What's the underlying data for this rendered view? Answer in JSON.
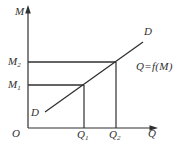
{
  "figure": {
    "background": "#ffffff",
    "ink_color": "#303030",
    "labels": {
      "y_axis": "M",
      "x_axis": "Q",
      "origin": "O",
      "curve_lower": "D",
      "curve_upper": "D",
      "function": "Q=f(M)"
    },
    "ticks": {
      "m2": {
        "base": "M",
        "sub": "2"
      },
      "m1": {
        "base": "M",
        "sub": "1"
      },
      "q1": {
        "base": "Q",
        "sub": "1"
      },
      "q2": {
        "base": "Q",
        "sub": "2"
      }
    },
    "geometry": {
      "width": 182,
      "height": 148,
      "lines": [
        {
          "name": "y-axis-line",
          "x1": 28,
          "y1": 128,
          "x2": 28,
          "y2": 10,
          "w": 1.2
        },
        {
          "name": "x-axis-line",
          "x1": 28,
          "y1": 128,
          "x2": 152,
          "y2": 128,
          "w": 1.2
        },
        {
          "name": "m2-level-line",
          "x1": 28,
          "y1": 62,
          "x2": 116,
          "y2": 62,
          "w": 1.6
        },
        {
          "name": "m1-level-line",
          "x1": 28,
          "y1": 85,
          "x2": 84,
          "y2": 85,
          "w": 1.6
        },
        {
          "name": "q2-projection-line",
          "x1": 116,
          "y1": 62,
          "x2": 116,
          "y2": 128,
          "w": 1.2
        },
        {
          "name": "q1-projection-line",
          "x1": 84,
          "y1": 85,
          "x2": 84,
          "y2": 128,
          "w": 1.2
        },
        {
          "name": "demand-line",
          "x1": 45,
          "y1": 112,
          "x2": 143,
          "y2": 42,
          "w": 1.3
        }
      ],
      "arrows": [
        {
          "name": "y-axis-arrow",
          "points": "28,5 25.2,13.5 30.8,13.5"
        },
        {
          "name": "x-axis-arrow",
          "points": "158,128 149.5,125.2 149.5,130.8"
        }
      ]
    }
  },
  "chart_data": {
    "type": "line",
    "title": "",
    "xlabel": "Q",
    "ylabel": "M",
    "origin_label": "O",
    "x_tick_labels": [
      "Q1",
      "Q2"
    ],
    "y_tick_labels": [
      "M1",
      "M2"
    ],
    "grid": false,
    "legend": null,
    "series": [
      {
        "name": "D",
        "equation": "Q=f(M)",
        "end_labels": [
          "D",
          "D"
        ],
        "note": "Straight upward-sloping line labeled D at both ends; passes through (Q1, M1) and (Q2, M2)",
        "points_axis_fraction": [
          {
            "x": 0.13,
            "y": 0.13
          },
          {
            "x": 0.43,
            "y": 0.36
          },
          {
            "x": 0.68,
            "y": 0.55
          },
          {
            "x": 0.88,
            "y": 0.72
          }
        ]
      }
    ],
    "reference_points": [
      {
        "x_label": "Q1",
        "y_label": "M1",
        "x_fraction": 0.43,
        "y_fraction": 0.36
      },
      {
        "x_label": "Q2",
        "y_label": "M2",
        "x_fraction": 0.68,
        "y_fraction": 0.55
      }
    ],
    "annotations": [
      {
        "text": "Q=f(M)",
        "position": "right of demand line, mid-upper area"
      }
    ]
  }
}
